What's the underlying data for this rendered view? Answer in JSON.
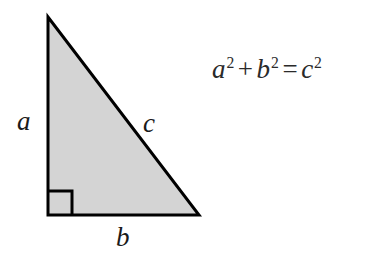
{
  "figure": {
    "background_color": "#ffffff",
    "triangle": {
      "fill_color": "#d4d4d4",
      "stroke_color": "#000000",
      "stroke_width": 3,
      "vertices": {
        "apex": [
          48,
          17
        ],
        "bottom_left": [
          48,
          215
        ],
        "bottom_right": [
          199,
          215
        ]
      },
      "right_angle_marker": {
        "corner": "bottom_left",
        "size": 24,
        "stroke_color": "#000000",
        "stroke_width": 3
      }
    },
    "labels": {
      "leg_vertical": "a",
      "leg_horizontal": "b",
      "hypotenuse": "c",
      "text_color": "#1a1a1a"
    },
    "equation": {
      "lhs_first_base": "a",
      "lhs_first_exp": "2",
      "plus": "+",
      "lhs_second_base": "b",
      "lhs_second_exp": "2",
      "equals": "=",
      "rhs_base": "c",
      "rhs_exp": "2",
      "plain_text": "a2 + b2 = c2",
      "text_color": "#2a2a2a"
    }
  }
}
